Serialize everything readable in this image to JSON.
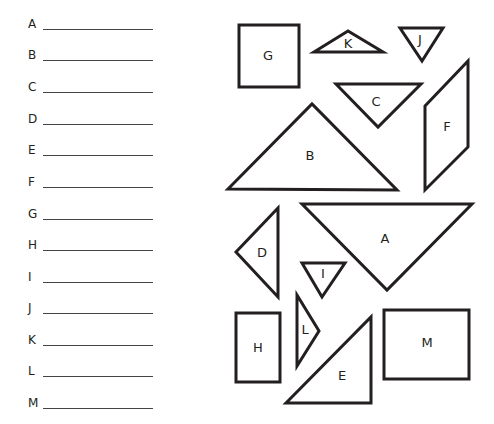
{
  "answer_sheet": {
    "rows": [
      {
        "letter": "A",
        "y": 16
      },
      {
        "letter": "B",
        "y": 47
      },
      {
        "letter": "C",
        "y": 79
      },
      {
        "letter": "D",
        "y": 111
      },
      {
        "letter": "E",
        "y": 142
      },
      {
        "letter": "F",
        "y": 174
      },
      {
        "letter": "G",
        "y": 206
      },
      {
        "letter": "H",
        "y": 237
      },
      {
        "letter": "I",
        "y": 269
      },
      {
        "letter": "J",
        "y": 300
      },
      {
        "letter": "K",
        "y": 332
      },
      {
        "letter": "L",
        "y": 363
      },
      {
        "letter": "M",
        "y": 395
      }
    ]
  },
  "shapes": {
    "stroke_color": "#231f20",
    "items": [
      {
        "label": "G",
        "kind": "square",
        "points": "239,25 299,25 299,87 239,87",
        "label_x": 268,
        "label_y": 56
      },
      {
        "label": "K",
        "kind": "triangle",
        "points": "314,52 348,31 383,52",
        "label_x": 348,
        "label_y": 44
      },
      {
        "label": "J",
        "kind": "triangle",
        "points": "400,28 443,28 422,61",
        "label_x": 420,
        "label_y": 40
      },
      {
        "label": "C",
        "kind": "triangle",
        "points": "336,84 421,84 378,127",
        "label_x": 376,
        "label_y": 102
      },
      {
        "label": "F",
        "kind": "parallelogram",
        "points": "425,106 468,61 468,147 425,190",
        "label_x": 447,
        "label_y": 127
      },
      {
        "label": "B",
        "kind": "triangle",
        "points": "228,189 312,104 397,190",
        "label_x": 310,
        "label_y": 156
      },
      {
        "label": "A",
        "kind": "triangle",
        "points": "302,204 472,204 387,290",
        "label_x": 385,
        "label_y": 239
      },
      {
        "label": "D",
        "kind": "triangle",
        "points": "278,208 278,297 236,252",
        "label_x": 262,
        "label_y": 253
      },
      {
        "label": "I",
        "kind": "triangle",
        "points": "302,263 345,263 322,297",
        "label_x": 323,
        "label_y": 274
      },
      {
        "label": "L",
        "kind": "triangle",
        "points": "297,295 319,331 297,366",
        "label_x": 305,
        "label_y": 330
      },
      {
        "label": "H",
        "kind": "rectangle",
        "points": "236,313 280,313 280,382 236,382",
        "label_x": 258,
        "label_y": 348
      },
      {
        "label": "E",
        "kind": "triangle",
        "points": "286,403 371,317 371,403",
        "label_x": 342,
        "label_y": 376
      },
      {
        "label": "M",
        "kind": "rectangle",
        "points": "384,310 469,310 469,379 384,379",
        "label_x": 427,
        "label_y": 343
      }
    ]
  }
}
